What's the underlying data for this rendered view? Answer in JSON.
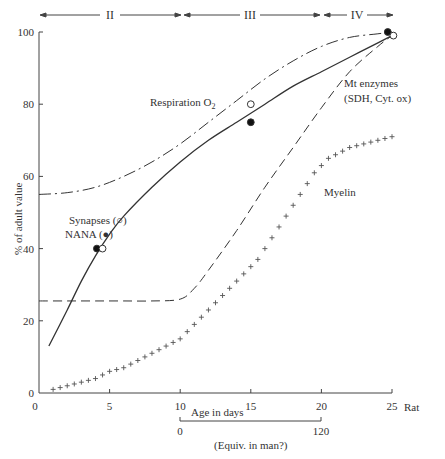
{
  "chart_data": {
    "type": "line",
    "title": "",
    "xlabel": "Age in days",
    "xlabel_suffix": "Rat",
    "ylabel": "% of adult value",
    "xlim": [
      0,
      25
    ],
    "ylim": [
      0,
      100
    ],
    "x_ticks": [
      "0",
      "5",
      "10",
      "15",
      "20",
      "25"
    ],
    "y_ticks": [
      "0",
      "20",
      "40",
      "60",
      "80",
      "100"
    ],
    "grid": false,
    "stages": [
      {
        "label": "II",
        "from": 0,
        "to": 10
      },
      {
        "label": "III",
        "from": 10,
        "to": 20
      },
      {
        "label": "IV",
        "from": 20,
        "to": 25
      }
    ],
    "secondary_axis": {
      "label": "(Equiv. in man?)",
      "from_day": 10,
      "to_day": 20,
      "start_label": "0",
      "end_label": "120"
    },
    "series": [
      {
        "name": "Respiration O2",
        "style": "dash-dot",
        "x": [
          0,
          2,
          4,
          6,
          8,
          10,
          12,
          14,
          16,
          18,
          20,
          22,
          24,
          25
        ],
        "values": [
          55,
          55.5,
          57,
          60,
          64,
          69,
          75,
          81,
          87,
          92,
          96,
          98.5,
          99.5,
          100
        ]
      },
      {
        "name": "Synapses / NANA (fitted)",
        "style": "solid",
        "x": [
          0.7,
          2,
          3,
          4,
          5,
          6,
          8,
          10,
          12,
          14,
          16,
          18,
          20,
          22,
          24,
          25
        ],
        "values": [
          13,
          23,
          31,
          38,
          44,
          49,
          57,
          64,
          70,
          75,
          80,
          85,
          89,
          93,
          97,
          99
        ]
      },
      {
        "name": "Mt enzymes (SDH, Cyt. ox)",
        "style": "dashed",
        "x": [
          0,
          2,
          4,
          6,
          8,
          10,
          11,
          12,
          14,
          16,
          18,
          20,
          22,
          24,
          25
        ],
        "values": [
          25.5,
          25.5,
          25.5,
          25.5,
          25.5,
          26,
          29,
          34,
          45,
          57,
          68,
          79,
          89,
          96,
          99
        ]
      },
      {
        "name": "Myelin",
        "style": "plus-markers",
        "x": [
          1,
          1.5,
          2,
          2.5,
          3,
          3.5,
          4,
          4.5,
          5,
          5.5,
          6,
          6.5,
          7,
          7.5,
          8,
          8.5,
          9,
          9.5,
          10,
          10.5,
          11,
          11.5,
          12,
          12.5,
          13,
          13.5,
          14,
          14.5,
          15,
          15.5,
          16,
          16.5,
          17,
          17.5,
          18,
          18.5,
          19,
          19.5,
          20,
          20.5,
          21,
          21.5,
          22,
          22.5,
          23,
          23.5,
          24,
          24.5,
          25
        ],
        "values": [
          1,
          1.5,
          2,
          2.5,
          3,
          3.5,
          4,
          5,
          6,
          6.5,
          7,
          8,
          9,
          10,
          11,
          12,
          13,
          14,
          15,
          17,
          19,
          21,
          23,
          25,
          27,
          29,
          31,
          33,
          35,
          37,
          40,
          43,
          46,
          49,
          52,
          55,
          58,
          61,
          63,
          65,
          66,
          67,
          68,
          68.5,
          69,
          69.5,
          70,
          70.5,
          71
        ]
      }
    ],
    "points": [
      {
        "series": "NANA",
        "marker": "filled",
        "x": 4.1,
        "y": 40
      },
      {
        "series": "Synapses",
        "marker": "open",
        "x": 4.5,
        "y": 40
      },
      {
        "series": "Respiration O2",
        "marker": "open",
        "x": 15,
        "y": 80
      },
      {
        "series": "NANA",
        "marker": "filled",
        "x": 15,
        "y": 75
      },
      {
        "series": "NANA",
        "marker": "filled",
        "x": 24.7,
        "y": 100
      },
      {
        "series": "Synapses",
        "marker": "open",
        "x": 25.1,
        "y": 99
      }
    ],
    "annotations": [
      {
        "text": "Respiration O",
        "sub": "2",
        "x": 8.7,
        "y": 83
      },
      {
        "text": "Mt enzymes",
        "x": 21.6,
        "y": 85
      },
      {
        "text": "(SDH, Cyt. ox)",
        "x": 21.6,
        "y": 80
      },
      {
        "text": "Myelin",
        "x": 20.6,
        "y": 58
      },
      {
        "text": "Synapses (○)",
        "x": 2.5,
        "y": 47.5
      },
      {
        "text": "NANA (●)",
        "x": 2.3,
        "y": 43.5
      }
    ]
  },
  "labels": {
    "ylabel": "% of adult value",
    "xlabel": "Age in days",
    "xlabel_suffix": "Rat",
    "man_axis_label": "(Equiv. in man?)",
    "man_start": "0",
    "man_end": "120",
    "stage_ii": "II",
    "stage_iii": "III",
    "stage_iv": "IV",
    "respiration": "Respiration O",
    "respiration_sub": "2",
    "mt_line1": "Mt enzymes",
    "mt_line2": "(SDH, Cyt. ox)",
    "myelin": "Myelin",
    "synapses": "Synapses (○)",
    "nana": "NANA (●)"
  }
}
